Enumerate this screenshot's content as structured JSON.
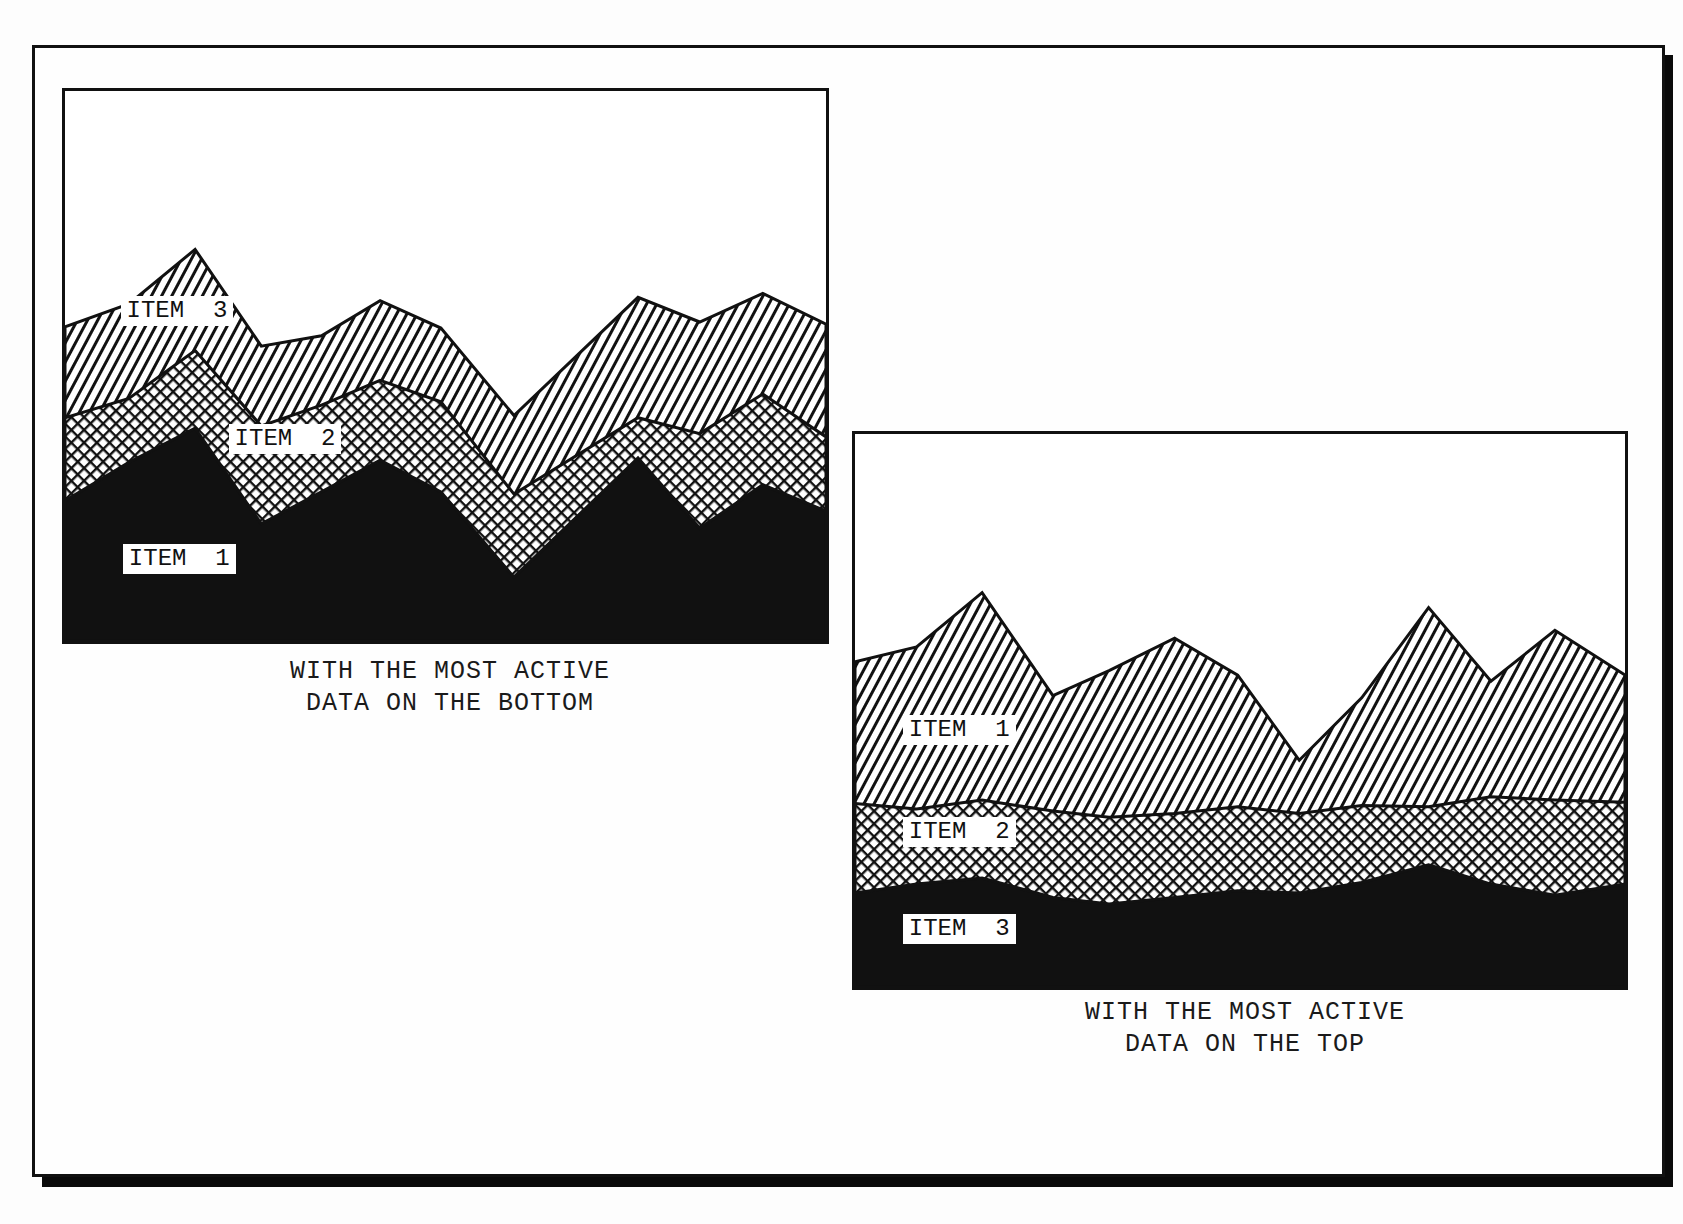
{
  "figure": {
    "panels": [
      {
        "id": "bottom",
        "caption_lines": [
          "WITH THE MOST ACTIVE",
          "DATA ON THE BOTTOM"
        ],
        "labels": [
          {
            "text": "ITEM  3",
            "series": "Item 3",
            "x": 0.073,
            "y": 0.4
          },
          {
            "text": "ITEM  2",
            "series": "Item 2",
            "x": 0.215,
            "y": 0.632
          },
          {
            "text": "ITEM  1",
            "series": "Item 1",
            "x": 0.076,
            "y": 0.85
          }
        ]
      },
      {
        "id": "top",
        "caption_lines": [
          "WITH THE MOST ACTIVE",
          "DATA ON THE TOP"
        ],
        "labels": [
          {
            "text": "ITEM  1",
            "series": "Item 1",
            "x": 0.062,
            "y": 0.535
          },
          {
            "text": "ITEM  2",
            "series": "Item 2",
            "x": 0.062,
            "y": 0.72
          },
          {
            "text": "ITEM  3",
            "series": "Item 3",
            "x": 0.062,
            "y": 0.895
          }
        ]
      }
    ],
    "colors": {
      "ink": "#111111",
      "paper": "#ffffff"
    }
  },
  "chart_data": [
    {
      "type": "area",
      "stacked": true,
      "title": "",
      "caption": "WITH THE MOST ACTIVE DATA ON THE BOTTOM",
      "xlabel": "",
      "ylabel": "",
      "ylim": [
        0,
        100
      ],
      "grid": false,
      "legend": "inline labels",
      "x": [
        0,
        0.084,
        0.171,
        0.258,
        0.337,
        0.414,
        0.494,
        0.59,
        0.753,
        0.834,
        0.917,
        1.0
      ],
      "series_note": "values are cumulative top edges of each stacked layer, 0-100 of plot height",
      "series": [
        {
          "name": "Item 1",
          "fill": "solid black",
          "values": [
            25.5,
            32.5,
            38.7,
            21.3,
            27.1,
            32.9,
            27.1,
            11.6,
            33.3,
            20.5,
            28.4,
            23.6
          ]
        },
        {
          "name": "Item 2",
          "fill": "crosshatch",
          "values": [
            40.6,
            44.1,
            52.8,
            39.1,
            42.9,
            47.4,
            43.5,
            26.7,
            40.6,
            37.7,
            44.9,
            37.1
          ]
        },
        {
          "name": "Item 3",
          "fill": "diagonal hatch",
          "values": [
            57.1,
            61.3,
            71.2,
            53.6,
            55.5,
            61.9,
            56.9,
            41.0,
            62.5,
            58.0,
            63.2,
            57.6
          ]
        }
      ]
    },
    {
      "type": "area",
      "stacked": true,
      "title": "",
      "caption": "WITH THE MOST ACTIVE DATA ON THE TOP",
      "xlabel": "",
      "ylabel": "",
      "ylim": [
        0,
        100
      ],
      "grid": false,
      "legend": "inline labels",
      "x": [
        0,
        0.08,
        0.165,
        0.257,
        0.33,
        0.415,
        0.497,
        0.577,
        0.658,
        0.745,
        0.826,
        0.909,
        1.0
      ],
      "series_note": "values are cumulative top edges of each stacked layer, 0-100 of plot height",
      "series": [
        {
          "name": "Item 3",
          "fill": "solid black",
          "values": [
            17.0,
            18.6,
            19.7,
            16.2,
            15.0,
            16.2,
            17.4,
            17.0,
            18.9,
            22.1,
            18.6,
            16.6,
            18.6
          ]
        },
        {
          "name": "Item 2",
          "fill": "crosshatch",
          "values": [
            33.2,
            32.2,
            33.8,
            31.8,
            30.7,
            31.4,
            32.6,
            31.4,
            32.8,
            32.6,
            34.4,
            33.8,
            33.4
          ]
        },
        {
          "name": "Item 1",
          "fill": "diagonal hatch",
          "values": [
            58.8,
            61.5,
            71.3,
            52.7,
            57.2,
            63.1,
            56.4,
            41.0,
            52.3,
            68.6,
            55.3,
            64.5,
            56.4
          ]
        }
      ]
    }
  ]
}
